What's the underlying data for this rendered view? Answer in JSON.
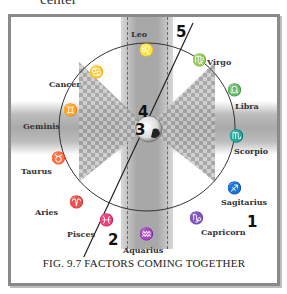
{
  "page_fragment": "center",
  "figure": {
    "caption_prefix": "Fig. 9.7",
    "caption_title": "Factors Coming Together",
    "caption_display": "FIG. 9.7 FACTORS COMING TOGETHER"
  },
  "zodiac": [
    {
      "name": "Leo",
      "symbol": "♌"
    },
    {
      "name": "Virgo",
      "symbol": "♍"
    },
    {
      "name": "Libra",
      "symbol": "♎"
    },
    {
      "name": "Scorpio",
      "symbol": "♏"
    },
    {
      "name": "Sagitarius",
      "symbol": "♐"
    },
    {
      "name": "Capricorn",
      "symbol": "♑"
    },
    {
      "name": "Aquarius",
      "symbol": "♒"
    },
    {
      "name": "Pisces",
      "symbol": "♓"
    },
    {
      "name": "Aries",
      "symbol": "♈"
    },
    {
      "name": "Taurus",
      "symbol": "♉"
    },
    {
      "name": "Geminis",
      "symbol": "♊"
    },
    {
      "name": "Cancer",
      "symbol": "♋"
    }
  ],
  "markers": [
    "1",
    "2",
    "3",
    "4",
    "5"
  ],
  "colors": {
    "frame": "#8a8a8a",
    "band": "#a9a9a9",
    "line": "#222222"
  }
}
